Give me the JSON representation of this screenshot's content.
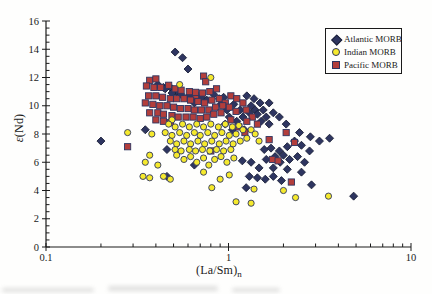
{
  "figure": {
    "background": "#fefefd",
    "text_color": "#1a1a1a",
    "axis_color": "#1a1a1a"
  },
  "chart_data": {
    "type": "scatter",
    "title": "",
    "xlabel_main": "(La/Sm)",
    "xlabel_sub": "n",
    "ylabel_epsilon": "ε",
    "ylabel_rest": "(Nd)",
    "x_scale": "log",
    "xlim": [
      0.1,
      10
    ],
    "ylim": [
      0,
      16
    ],
    "x_tick_labels": [
      "0.1",
      "1",
      "10"
    ],
    "x_tick_values": [
      0.1,
      1,
      10
    ],
    "y_tick_values": [
      0,
      2,
      4,
      6,
      8,
      10,
      12,
      14,
      16
    ],
    "y_tick_labels": [
      "0",
      "2",
      "4",
      "6",
      "8",
      "10",
      "12",
      "14",
      "16"
    ],
    "y_minor_step": 0.5,
    "grid": false,
    "legend_position": "top-right",
    "series": [
      {
        "name": "Atlantic MORB",
        "marker": "diamond",
        "fill": "#2e3560",
        "stroke": "#1b2038",
        "points": [
          [
            0.51,
            13.8
          ],
          [
            0.56,
            13.4
          ],
          [
            0.6,
            12.6
          ],
          [
            0.41,
            11.5
          ],
          [
            0.44,
            11.3
          ],
          [
            0.49,
            11.2
          ],
          [
            0.52,
            11.0
          ],
          [
            0.55,
            10.8
          ],
          [
            0.61,
            10.7
          ],
          [
            0.45,
            11.2
          ],
          [
            0.49,
            10.9
          ],
          [
            0.65,
            10.5
          ],
          [
            0.71,
            10.6
          ],
          [
            0.76,
            10.4
          ],
          [
            0.65,
            10.2
          ],
          [
            0.83,
            10.8
          ],
          [
            0.89,
            10.5
          ],
          [
            0.94,
            10.6
          ],
          [
            1.26,
            10.7
          ],
          [
            1.38,
            10.5
          ],
          [
            1.33,
            10.0
          ],
          [
            1.49,
            10.2
          ],
          [
            1.67,
            10.2
          ],
          [
            1.4,
            9.7
          ],
          [
            1.55,
            9.7
          ],
          [
            1.3,
            9.5
          ],
          [
            1.44,
            9.4
          ],
          [
            1.61,
            9.2
          ],
          [
            1.76,
            9.5
          ],
          [
            1.9,
            9.2
          ],
          [
            1.51,
            8.9
          ],
          [
            1.67,
            8.7
          ],
          [
            2.07,
            8.7
          ],
          [
            2.45,
            8.1
          ],
          [
            2.81,
            7.8
          ],
          [
            3.15,
            7.5
          ],
          [
            3.58,
            7.7
          ],
          [
            0.91,
            10.1
          ],
          [
            0.98,
            9.7
          ],
          [
            1.07,
            10.1
          ],
          [
            1.16,
            9.7
          ],
          [
            1.01,
            9.2
          ],
          [
            1.11,
            8.9
          ],
          [
            1.2,
            9.2
          ],
          [
            0.96,
            8.7
          ],
          [
            1.05,
            8.3
          ],
          [
            1.22,
            8.3
          ],
          [
            1.57,
            6.9
          ],
          [
            1.71,
            7.0
          ],
          [
            1.9,
            6.8
          ],
          [
            2.1,
            7.1
          ],
          [
            2.3,
            7.5
          ],
          [
            2.51,
            7.2
          ],
          [
            2.78,
            6.8
          ],
          [
            1.8,
            6.4
          ],
          [
            2.0,
            6.5
          ],
          [
            2.16,
            6.2
          ],
          [
            2.39,
            6.4
          ],
          [
            2.61,
            6.0
          ],
          [
            0.46,
            5.0
          ],
          [
            0.65,
            5.8
          ],
          [
            1.19,
            6.1
          ],
          [
            1.33,
            6.0
          ],
          [
            1.47,
            5.6
          ],
          [
            1.61,
            6.2
          ],
          [
            1.76,
            5.6
          ],
          [
            1.92,
            6.0
          ],
          [
            2.1,
            5.5
          ],
          [
            1.3,
            5.0
          ],
          [
            1.44,
            4.9
          ],
          [
            1.59,
            4.8
          ],
          [
            1.76,
            5.0
          ],
          [
            1.95,
            4.7
          ],
          [
            1.25,
            4.2
          ],
          [
            2.85,
            4.4
          ],
          [
            4.85,
            3.6
          ],
          [
            0.2,
            7.5
          ],
          [
            0.35,
            8.3
          ],
          [
            0.46,
            6.9
          ],
          [
            2.51,
            5.3
          ]
        ]
      },
      {
        "name": "Indian MORB",
        "marker": "circle",
        "fill": "#f5e92d",
        "stroke": "#2e3560",
        "points": [
          [
            0.8,
            12.0
          ],
          [
            0.54,
            11.5
          ],
          [
            0.28,
            8.1
          ],
          [
            0.38,
            8.0
          ],
          [
            0.34,
            5.0
          ],
          [
            0.49,
            9.0
          ],
          [
            0.47,
            8.7
          ],
          [
            0.51,
            8.5
          ],
          [
            0.56,
            8.7
          ],
          [
            0.61,
            8.5
          ],
          [
            0.67,
            8.7
          ],
          [
            0.73,
            8.5
          ],
          [
            0.8,
            8.7
          ],
          [
            0.88,
            8.5
          ],
          [
            0.96,
            8.7
          ],
          [
            1.05,
            8.5
          ],
          [
            1.14,
            8.6
          ],
          [
            0.45,
            8.1
          ],
          [
            0.49,
            7.9
          ],
          [
            0.54,
            8.1
          ],
          [
            0.59,
            7.9
          ],
          [
            0.65,
            8.1
          ],
          [
            0.7,
            7.9
          ],
          [
            0.77,
            8.1
          ],
          [
            0.84,
            7.9
          ],
          [
            0.92,
            8.1
          ],
          [
            1.01,
            7.9
          ],
          [
            1.1,
            8.0
          ],
          [
            1.2,
            8.3
          ],
          [
            0.48,
            7.5
          ],
          [
            0.52,
            7.3
          ],
          [
            0.57,
            7.5
          ],
          [
            0.62,
            7.3
          ],
          [
            0.68,
            7.5
          ],
          [
            0.74,
            7.3
          ],
          [
            0.81,
            7.5
          ],
          [
            0.89,
            7.3
          ],
          [
            0.97,
            7.5
          ],
          [
            1.06,
            7.3
          ],
          [
            1.16,
            7.5
          ],
          [
            1.26,
            7.7
          ],
          [
            0.51,
            6.9
          ],
          [
            0.55,
            6.8
          ],
          [
            0.61,
            6.9
          ],
          [
            0.66,
            6.8
          ],
          [
            0.72,
            6.9
          ],
          [
            0.79,
            6.8
          ],
          [
            0.86,
            6.9
          ],
          [
            0.94,
            6.8
          ],
          [
            1.03,
            6.9
          ],
          [
            1.33,
            8.3
          ],
          [
            1.4,
            8.0
          ],
          [
            1.47,
            7.5
          ],
          [
            0.35,
            6.0
          ],
          [
            0.37,
            6.5
          ],
          [
            0.41,
            5.8
          ],
          [
            0.44,
            5.0
          ],
          [
            0.37,
            4.9
          ],
          [
            0.48,
            4.8
          ],
          [
            0.52,
            6.5
          ],
          [
            0.57,
            6.2
          ],
          [
            0.62,
            6.4
          ],
          [
            0.67,
            6.0
          ],
          [
            0.73,
            6.3
          ],
          [
            0.78,
            5.8
          ],
          [
            0.84,
            6.2
          ],
          [
            0.91,
            6.4
          ],
          [
            0.98,
            6.0
          ],
          [
            1.07,
            6.3
          ],
          [
            0.73,
            5.3
          ],
          [
            0.81,
            4.2
          ],
          [
            0.9,
            4.8
          ],
          [
            1.01,
            5.1
          ],
          [
            1.38,
            4.1
          ],
          [
            2.0,
            4.0
          ],
          [
            2.33,
            3.5
          ],
          [
            3.53,
            3.6
          ],
          [
            1.1,
            3.2
          ],
          [
            1.33,
            3.1
          ]
        ]
      },
      {
        "name": "Pacific MORB",
        "marker": "square",
        "fill": "#b33e3b",
        "stroke": "#2e3560",
        "points": [
          [
            0.37,
            11.8
          ],
          [
            0.4,
            11.9
          ],
          [
            0.355,
            11.4
          ],
          [
            0.73,
            12.1
          ],
          [
            0.75,
            11.7
          ],
          [
            0.66,
            10.7
          ],
          [
            0.39,
            11.3
          ],
          [
            0.425,
            11.3
          ],
          [
            0.47,
            11.45
          ],
          [
            0.51,
            11.2
          ],
          [
            0.55,
            11.1
          ],
          [
            0.61,
            11.0
          ],
          [
            0.66,
            10.95
          ],
          [
            0.72,
            10.9
          ],
          [
            0.79,
            11.0
          ],
          [
            0.86,
            11.2
          ],
          [
            0.365,
            10.7
          ],
          [
            0.4,
            10.7
          ],
          [
            0.435,
            10.6
          ],
          [
            0.48,
            10.5
          ],
          [
            0.52,
            10.5
          ],
          [
            0.57,
            10.5
          ],
          [
            0.62,
            10.4
          ],
          [
            0.68,
            10.3
          ],
          [
            0.74,
            10.2
          ],
          [
            0.81,
            10.4
          ],
          [
            0.89,
            10.5
          ],
          [
            0.96,
            10.2
          ],
          [
            0.35,
            10.2
          ],
          [
            0.385,
            10.1
          ],
          [
            0.42,
            10.0
          ],
          [
            0.46,
            10.0
          ],
          [
            0.5,
            9.9
          ],
          [
            0.545,
            9.8
          ],
          [
            0.6,
            9.8
          ],
          [
            0.65,
            9.7
          ],
          [
            0.71,
            9.7
          ],
          [
            0.78,
            9.7
          ],
          [
            0.85,
            9.9
          ],
          [
            0.93,
            10.0
          ],
          [
            0.37,
            9.5
          ],
          [
            0.41,
            9.5
          ],
          [
            0.44,
            9.4
          ],
          [
            0.49,
            9.3
          ],
          [
            0.53,
            9.2
          ],
          [
            0.585,
            9.2
          ],
          [
            0.64,
            9.2
          ],
          [
            0.7,
            9.1
          ],
          [
            0.76,
            9.2
          ],
          [
            0.83,
            9.4
          ],
          [
            0.91,
            9.5
          ],
          [
            0.4,
            9.0
          ],
          [
            0.44,
            8.9
          ],
          [
            0.48,
            8.8
          ],
          [
            1.03,
            10.7
          ],
          [
            1.11,
            10.5
          ],
          [
            1.2,
            10.2
          ],
          [
            1.01,
            9.9
          ],
          [
            1.1,
            9.6
          ],
          [
            1.25,
            9.7
          ],
          [
            1.35,
            9.2
          ],
          [
            1.26,
            8.9
          ],
          [
            1.44,
            8.7
          ],
          [
            1.03,
            9.0
          ],
          [
            1.14,
            8.5
          ],
          [
            1.23,
            8.1
          ],
          [
            1.67,
            7.6
          ],
          [
            2.07,
            8.1
          ],
          [
            2.3,
            7.4
          ],
          [
            1.74,
            6.2
          ],
          [
            1.87,
            6.1
          ],
          [
            2.21,
            4.6
          ],
          [
            0.8,
            6.8
          ],
          [
            0.28,
            7.1
          ]
        ]
      }
    ]
  }
}
